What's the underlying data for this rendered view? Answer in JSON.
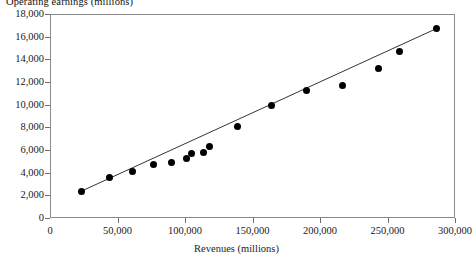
{
  "chart_data": {
    "type": "scatter",
    "title": "Operating earnings (millions)",
    "xlabel": "Revenues (millions)",
    "ylabel": "Operating earnings (millions)",
    "xlim": [
      0,
      300000
    ],
    "ylim": [
      0,
      18000
    ],
    "grid": false,
    "legend": null,
    "xticks": [
      0,
      50000,
      100000,
      150000,
      200000,
      250000,
      300000
    ],
    "xtick_labels": [
      "0",
      "50,000",
      "100,000",
      "150,000",
      "200,000",
      "250,000",
      "300,000"
    ],
    "yticks": [
      0,
      2000,
      4000,
      6000,
      8000,
      10000,
      12000,
      14000,
      16000,
      18000
    ],
    "ytick_labels": [
      "0",
      "2,000",
      "4,000",
      "6,000",
      "8,000",
      "10,000",
      "12,000",
      "14,000",
      "16,000",
      "18,000"
    ],
    "marker": "filled-circle",
    "marker_color": "#000000",
    "trendline": {
      "present": true,
      "color": "#333333",
      "x_start": 22000,
      "y_start": 2300,
      "x_end": 286000,
      "y_end": 16700
    },
    "points": [
      {
        "x": 23500,
        "y": 2380
      },
      {
        "x": 44000,
        "y": 3530
      },
      {
        "x": 61000,
        "y": 4060
      },
      {
        "x": 77000,
        "y": 4680
      },
      {
        "x": 90000,
        "y": 4940
      },
      {
        "x": 101000,
        "y": 5290
      },
      {
        "x": 105000,
        "y": 5650
      },
      {
        "x": 114000,
        "y": 5740
      },
      {
        "x": 118000,
        "y": 6350
      },
      {
        "x": 139000,
        "y": 8030
      },
      {
        "x": 164000,
        "y": 9970
      },
      {
        "x": 190000,
        "y": 11290
      },
      {
        "x": 217000,
        "y": 11730
      },
      {
        "x": 243000,
        "y": 13180
      },
      {
        "x": 259000,
        "y": 14660
      },
      {
        "x": 286000,
        "y": 16700
      }
    ]
  },
  "axis": {
    "x_caption": "Revenues (millions)",
    "y_caption": "Operating earnings (millions)"
  }
}
